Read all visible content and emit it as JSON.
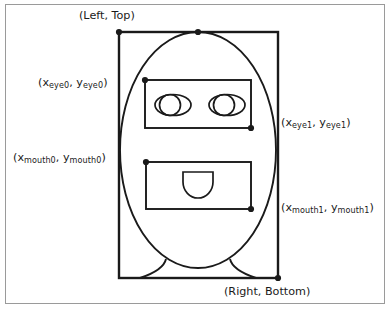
{
  "figure": {
    "background_color": "#ffffff",
    "border_color": "#9a9a9a",
    "stroke_color": "#1a1a1a"
  },
  "labels": {
    "left_top": "(Left, Top)",
    "right_bottom": "(Right, Bottom)",
    "eye0": {
      "open_paren": "(",
      "x_var": "x",
      "x_sub": "eye0",
      "comma": ", ",
      "y_var": "y",
      "y_sub": "eye0",
      "close_paren": ")",
      "full": "(x eye0, y eye0)"
    },
    "eye1": {
      "open_paren": "(",
      "x_var": "x",
      "x_sub": "eye1",
      "comma": ", ",
      "y_var": "y",
      "y_sub": "eye1",
      "close_paren": ")",
      "full": "(x eye1, y eye1)"
    },
    "mouth0": {
      "open_paren": "(",
      "x_var": "x",
      "x_sub": "mouth0",
      "comma": ", ",
      "y_var": "y",
      "y_sub": "mouth0",
      "close_paren": ")",
      "full": "(x mouth0, y mouth0)"
    },
    "mouth1": {
      "open_paren": "(",
      "x_var": "x",
      "x_sub": "mouth1",
      "comma": ", ",
      "y_var": "y",
      "y_sub": "mouth1",
      "close_paren": ")",
      "full": "(x mouth1, y mouth1)"
    }
  },
  "shapes": {
    "face_box": {
      "name": "face-bounding-box",
      "x": 119,
      "y": 32,
      "width": 159,
      "height": 246
    },
    "head_ellipse": {
      "name": "head-outline-ellipse",
      "cx": 198,
      "cy": 150,
      "rx": 78,
      "ry": 118
    },
    "eye_rect": {
      "name": "eye-region-rectangle",
      "x": 145,
      "y": 80,
      "width": 106,
      "height": 48
    },
    "mouth_rect": {
      "name": "mouth-region-rectangle",
      "x": 146,
      "y": 162,
      "width": 105,
      "height": 47
    },
    "left_eye": {
      "name": "left-eye",
      "cx": 171,
      "cy": 105
    },
    "right_eye": {
      "name": "right-eye",
      "cx": 225,
      "cy": 105
    },
    "mouth": {
      "name": "mouth-shape",
      "cx": 198,
      "cy": 182
    },
    "neck_left": {
      "name": "neck-left-curve"
    },
    "neck_right": {
      "name": "neck-right-curve"
    },
    "markers": [
      {
        "name": "marker-left-top",
        "x": 119,
        "y": 32
      },
      {
        "name": "marker-head-top-center",
        "x": 198,
        "y": 32
      },
      {
        "name": "marker-eye0",
        "x": 145,
        "y": 80
      },
      {
        "name": "marker-eye1",
        "x": 251,
        "y": 128
      },
      {
        "name": "marker-mouth0",
        "x": 146,
        "y": 162
      },
      {
        "name": "marker-mouth1",
        "x": 251,
        "y": 209
      },
      {
        "name": "marker-right-bottom",
        "x": 278,
        "y": 278
      }
    ]
  }
}
